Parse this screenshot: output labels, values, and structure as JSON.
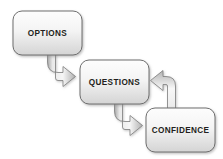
{
  "diagram": {
    "background_color": "#ffffff",
    "box_fill_top": "#fbfbfb",
    "box_fill_bottom": "#d8d8d8",
    "box_border_color": "#6e6e6e",
    "arrow_fill_light": "#f2f2f2",
    "arrow_fill_dark": "#b9b9b9",
    "arrow_border_color": "#7a7a7a",
    "label_color": "#231f20",
    "nodes": [
      {
        "id": "options",
        "label": "OPTIONS",
        "x": 13,
        "y": 11,
        "width": 69,
        "height": 44,
        "center_x": 47.5,
        "center_y": 33
      },
      {
        "id": "questions",
        "label": "QUESTIONS",
        "x": 80,
        "y": 60,
        "width": 69,
        "height": 44,
        "center_x": 114.5,
        "center_y": 82
      },
      {
        "id": "confidence",
        "label": "CONFIDENCE",
        "x": 146,
        "y": 108,
        "width": 69,
        "height": 44,
        "center_x": 180.5,
        "center_y": 130
      }
    ],
    "connectors": [
      {
        "id": "options-to-questions",
        "from": "options",
        "to": "questions",
        "direction": "down-then-right",
        "label": ""
      },
      {
        "id": "questions-to-confidence",
        "from": "questions",
        "to": "confidence",
        "direction": "down-then-right",
        "label": ""
      },
      {
        "id": "confidence-to-questions",
        "from": "confidence",
        "to": "questions",
        "direction": "up-then-left",
        "label": ""
      }
    ]
  }
}
